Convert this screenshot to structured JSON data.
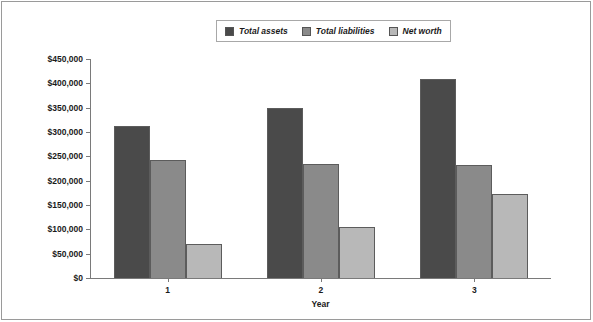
{
  "chart_data": {
    "type": "bar",
    "title": "",
    "xlabel": "Year",
    "ylabel": "",
    "categories": [
      "1",
      "2",
      "3"
    ],
    "series": [
      {
        "name": "Total assets",
        "values": [
          312000,
          350000,
          408000
        ],
        "color": "#4a4a4a"
      },
      {
        "name": "Total liabilities",
        "values": [
          243000,
          235000,
          232000
        ],
        "color": "#8a8a8a"
      },
      {
        "name": "Net worth",
        "values": [
          69000,
          105000,
          172000
        ],
        "color": "#b8b8b8"
      }
    ],
    "ylim": [
      0,
      450000
    ],
    "ytick_step": 50000,
    "ytick_labels": [
      "$450,000",
      "$400,000",
      "$350,000",
      "$300,000",
      "$250,000",
      "$200,000",
      "$150,000",
      "$100,000",
      "$50,000",
      "$0"
    ],
    "ytick_values": [
      450000,
      400000,
      350000,
      300000,
      250000,
      200000,
      150000,
      100000,
      50000,
      0
    ],
    "grid": false,
    "legend_position": "top-center"
  },
  "legend": {
    "items": [
      {
        "label": "Total assets",
        "color": "#4a4a4a"
      },
      {
        "label": "Total liabilities",
        "color": "#8a8a8a"
      },
      {
        "label": "Net worth",
        "color": "#b8b8b8"
      }
    ]
  },
  "axis": {
    "x_title": "Year"
  }
}
